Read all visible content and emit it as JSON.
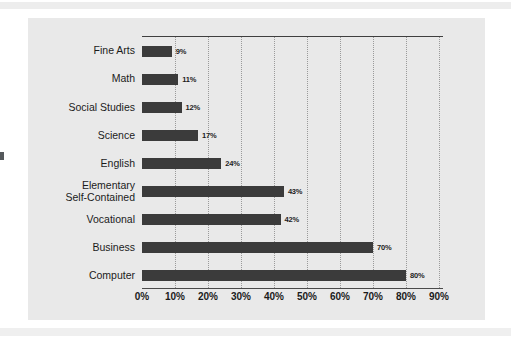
{
  "chart_data": {
    "type": "bar",
    "orientation": "horizontal",
    "title": "",
    "xlabel": "",
    "ylabel": "",
    "xlim": [
      0,
      90
    ],
    "xtick_step": 10,
    "grid": "vertical-dotted",
    "legend": "none",
    "bar_color": "#3b3b3b",
    "panel_color": "#e9e9e9",
    "categories": [
      "Fine Arts",
      "Math",
      "Social Studies",
      "Science",
      "English",
      "Elementary\nSelf-Contained",
      "Vocational",
      "Business",
      "Computer"
    ],
    "values": [
      9,
      11,
      12,
      17,
      24,
      43,
      42,
      70,
      80
    ],
    "data_labels": [
      "9%",
      "11%",
      "12%",
      "17%",
      "24%",
      "43%",
      "42%",
      "70%",
      "80%"
    ],
    "xtick_labels": [
      "0%",
      "10%",
      "20%",
      "30%",
      "40%",
      "50%",
      "60%",
      "70%",
      "80%",
      "90%"
    ],
    "xtick_values": [
      0,
      10,
      20,
      30,
      40,
      50,
      60,
      70,
      80,
      90
    ]
  }
}
